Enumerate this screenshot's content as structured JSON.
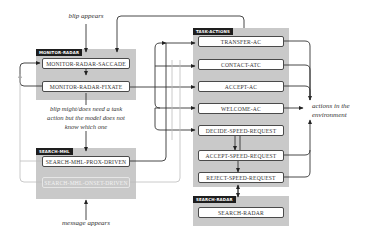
{
  "labels": {
    "blip_appears": "blip appears",
    "blip_needs_action_line1": "blip might/does need a task",
    "blip_needs_action_line2": "action but the model does not",
    "blip_needs_action_line3": "know which one",
    "message_appears": "message appears",
    "actions_env_line1": "actions in the",
    "actions_env_line2": "environment"
  },
  "groups": {
    "monitor_radar": {
      "tag": "MONITOR-RADAR",
      "nodes": [
        "MONITOR-RADAR-SACCADE",
        "MONITOR-RADAR-FIXATE"
      ]
    },
    "search_mhl": {
      "tag": "SEARCH-MHL",
      "nodes": [
        "SEARCH-MHL-PROX-DRIVEN",
        "SEARCH-MHL-ONSET-DRIVEN"
      ]
    },
    "task_actions": {
      "tag": "TASK-ACTIONS",
      "nodes": [
        "TRANSFER-AC",
        "CONTACT-ATC",
        "ACCEPT-AC",
        "WELCOME-AC",
        "DECIDE-SPEED-REQUEST",
        "ACCEPT-SPEED-REQUEST",
        "REJECT-SPEED-REQUEST"
      ]
    },
    "search_radar": {
      "tag": "SEARCH-RADAR",
      "nodes": [
        "SEARCH-RADAR"
      ]
    }
  },
  "colors": {
    "group_bg": "#c9c9c9",
    "tag_bg": "#1e1e1e",
    "line": "#333333",
    "faded_line": "#bdbdbd"
  }
}
